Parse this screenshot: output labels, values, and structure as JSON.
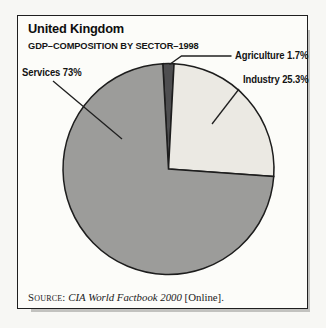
{
  "figure": {
    "title": "United Kingdom",
    "subtitle": "GDP–COMPOSITION BY SECTOR–1998",
    "source_prefix": "Source:",
    "source_work": "CIA World Factbook 2000",
    "source_suffix": "[Online]."
  },
  "chart_data": {
    "type": "pie",
    "title": "United Kingdom",
    "subtitle": "GDP–COMPOSITION BY SECTOR–1998",
    "slices": [
      {
        "label": "Agriculture",
        "value": 1.7,
        "display": "Agriculture 1.7%",
        "color": "#4e4e50"
      },
      {
        "label": "Industry",
        "value": 25.3,
        "display": "Industry 25.3%",
        "color": "#ebe9e3"
      },
      {
        "label": "Services",
        "value": 73,
        "display": "Services 73%",
        "color": "#9c9c9a"
      }
    ],
    "start_angle_deg": -3.1,
    "direction": "clockwise",
    "stroke_color": "#1d1d1d",
    "legend": "none",
    "source_note": "Source: CIA World Factbook 2000 [Online]."
  }
}
